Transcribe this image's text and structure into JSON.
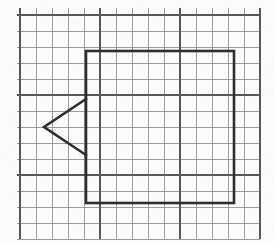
{
  "figure": {
    "background_color": "#fbfbf9",
    "shape_stroke_color": "#2f2f2f",
    "shape_stroke_width": 2.6
  },
  "grid": {
    "cell_size": 16,
    "minor_line_color": "#8e9196",
    "major_line_color": "#55585c",
    "major_every": 5,
    "origin_x": 20,
    "origin_y": 15,
    "columns": 15,
    "rows": 14,
    "left_margin": 20,
    "top_margin": 15,
    "right_edge": 260,
    "bottom_edge": 239
  },
  "shapes": [
    {
      "name": "square",
      "type": "rect",
      "x": 86,
      "y": 51,
      "width": 148,
      "height": 152,
      "cells_wide": 9,
      "cells_high": 9
    },
    {
      "name": "triangle",
      "type": "polyline",
      "points": "86,99 44,127 86,155",
      "apex_x": 44,
      "apex_y": 127,
      "top_vertex_x": 86,
      "top_vertex_y": 99,
      "bottom_vertex_x": 86,
      "bottom_vertex_y": 155,
      "direction": "left"
    }
  ]
}
